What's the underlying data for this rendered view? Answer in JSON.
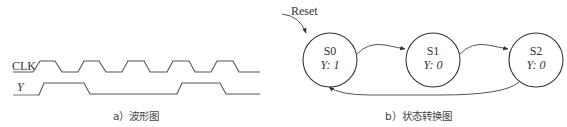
{
  "waveform": {
    "clk_label": "CLK",
    "y_label": "Y",
    "caption": "a）波形图",
    "clk_edges": {
      "rise": [
        36,
        81,
        125,
        170,
        214
      ],
      "fall": [
        57,
        100,
        145,
        190,
        235
      ]
    },
    "y_sequence": [
      0,
      1,
      1,
      0,
      0,
      1,
      0
    ],
    "color": "#555555"
  },
  "state_diagram": {
    "reset_label": "Reset",
    "caption": "b）状态转换图",
    "states": [
      {
        "name": "S0",
        "output": "Y: 1"
      },
      {
        "name": "S1",
        "output": "Y: 0"
      },
      {
        "name": "S2",
        "output": "Y: 0"
      }
    ],
    "transitions": [
      {
        "from": "Reset",
        "to": "S0"
      },
      {
        "from": "S0",
        "to": "S1"
      },
      {
        "from": "S1",
        "to": "S2"
      },
      {
        "from": "S2",
        "to": "S0"
      }
    ]
  }
}
